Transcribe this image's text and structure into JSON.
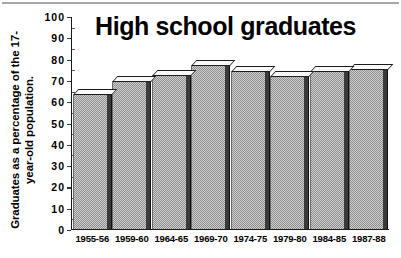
{
  "chart_data": {
    "type": "bar",
    "title": "High school graduates",
    "xlabel": "",
    "ylabel": "Graduates as a percentage of the 17-year-old population.",
    "ylabel_line1": "Graduates as a percentage of the 17-",
    "ylabel_line2": "year-old population.",
    "categories": [
      "1955-56",
      "1959-60",
      "1964-65",
      "1969-70",
      "1974-75",
      "1979-80",
      "1984-85",
      "1987-88"
    ],
    "values": [
      63,
      69.5,
      72,
      77,
      74,
      71.5,
      74,
      75
    ],
    "ylim": [
      0,
      100
    ],
    "yticks": [
      0,
      10,
      20,
      30,
      40,
      50,
      60,
      70,
      80,
      90,
      100
    ],
    "ytick_labels": [
      "0",
      "10",
      "20",
      "30",
      "40",
      "50",
      "60",
      "70",
      "80",
      "90",
      "100"
    ],
    "grid": false,
    "legend": null,
    "style": "3d-bar",
    "colors": {
      "bar_fill": "#cfcfcf",
      "bar_pattern": "#8e8e8e",
      "bar_side": "#3a3a3a",
      "bar_top": "#fafafa",
      "axis": "#1a1a1a",
      "text": "#000000",
      "background": "#ffffff"
    }
  }
}
